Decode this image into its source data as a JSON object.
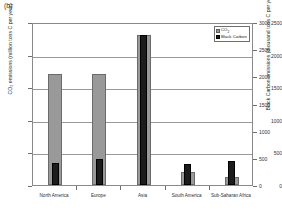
{
  "panel_label": "(b)",
  "legend": {
    "entries": [
      {
        "label": "CO",
        "sub": "2",
        "color": "#999999",
        "swatch": "co2"
      },
      {
        "label": "Black Carbon",
        "sub": "",
        "color": "#1c1c1c",
        "swatch": "bc"
      }
    ]
  },
  "chart_data": {
    "type": "bar",
    "title": "",
    "subtitle": "",
    "panel": "(b)",
    "xlabel": "",
    "ylabel": "CO2 emissions (million tons C per year)",
    "ylabel_secondary": "Black Carbon emissions (thousand tons C per year)",
    "categories": [
      "North America",
      "Europe",
      "Asia",
      "South America",
      "Sub-Saharan Africa"
    ],
    "series": [
      {
        "name": "CO2",
        "axis": "left",
        "color": "#999999",
        "values": [
          1700,
          1700,
          2300,
          200,
          130
        ]
      },
      {
        "name": "Black Carbon",
        "axis": "right",
        "color": "#1c1c1c",
        "values": [
          400,
          480,
          2760,
          380,
          440
        ]
      }
    ],
    "ylim": [
      0,
      2500
    ],
    "yticks": [
      0,
      500,
      1000,
      1500,
      2000,
      2500
    ],
    "ytick_labels": [
      "0",
      "500",
      "1000",
      "1500",
      "2000",
      "2500"
    ],
    "ylim_secondary": [
      0,
      3000
    ],
    "yticks_secondary": [
      0,
      500,
      1000,
      1500,
      2000,
      2500,
      3000
    ],
    "ytick_labels_secondary": [
      "0",
      "500",
      "1000",
      "1500",
      "2000",
      "2500",
      "3000"
    ],
    "grid": true,
    "legend_position": "top-right-inside"
  }
}
